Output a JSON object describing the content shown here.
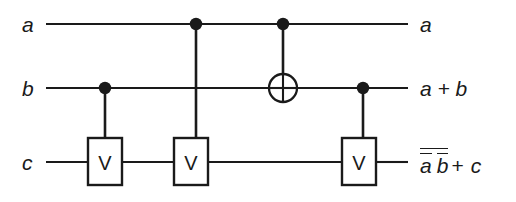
{
  "diagram": {
    "kind": "quantum-circuit",
    "background_color": "#ffffff",
    "ink_color": "#1a1a1a",
    "width": 516,
    "height": 202
  },
  "wires": [
    {
      "id": "a",
      "input_label": "a",
      "output_label": "a",
      "y": 24,
      "x_start": 46,
      "x_end": 408
    },
    {
      "id": "b",
      "input_label": "b",
      "output_label": "a + b",
      "y": 88,
      "x_start": 46,
      "x_end": 408
    },
    {
      "id": "c",
      "input_label": "c",
      "output_label": "abc",
      "y": 162,
      "x_start": 46,
      "x_end": 408
    }
  ],
  "input_labels": [
    {
      "text": "a",
      "x": 36,
      "y": 24
    },
    {
      "text": "b",
      "x": 36,
      "y": 88
    },
    {
      "text": "c",
      "x": 36,
      "y": 162
    }
  ],
  "output_labels": [
    {
      "text": "a",
      "x": 420,
      "y": 24
    },
    {
      "text": "a + b",
      "x": 420,
      "y": 88
    }
  ],
  "output_expression": {
    "x": 420,
    "y": 162,
    "description": "complement of (not-a and not-b) plus c",
    "outer_negated": true,
    "operand_1": "a",
    "operand_1_negated": true,
    "operand_2": "b",
    "operand_2_negated": true,
    "operator": "+",
    "operand_3": "c"
  },
  "gates": [
    {
      "id": "v1",
      "type": "V",
      "label": "V",
      "target_wire": "c",
      "control_wire": "b",
      "box": {
        "x": 88,
        "y": 138,
        "w": 34,
        "h": 47
      },
      "control_dot": {
        "x": 105,
        "y": 88,
        "r": 6.2
      }
    },
    {
      "id": "v2",
      "type": "V",
      "label": "V",
      "target_wire": "c",
      "control_wire": "a",
      "box": {
        "x": 174,
        "y": 138,
        "w": 34,
        "h": 47
      },
      "control_dot": {
        "x": 196,
        "y": 24,
        "r": 6.2
      }
    },
    {
      "id": "cnot",
      "type": "CNOT",
      "label": "",
      "target_wire": "b",
      "control_wire": "a",
      "target": {
        "x": 283,
        "y": 88,
        "r": 14
      },
      "control_dot": {
        "x": 283,
        "y": 24,
        "r": 6.2
      }
    },
    {
      "id": "v3",
      "type": "V",
      "label": "V",
      "target_wire": "c",
      "control_wire": "b",
      "box": {
        "x": 342,
        "y": 138,
        "w": 34,
        "h": 47
      },
      "control_dot": {
        "x": 363,
        "y": 88,
        "r": 6.2
      }
    }
  ]
}
